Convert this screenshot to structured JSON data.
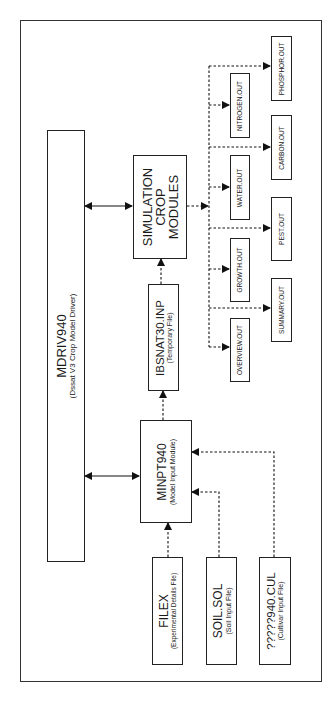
{
  "diagram": {
    "driver": {
      "title": "MDRIV940",
      "subtitle": "(Dssat V3 Crop Model Driver)"
    },
    "simulation": {
      "line1": "SIMULATION",
      "line2": "CROP",
      "line3": "MODULES"
    },
    "temp_file": {
      "title": "IBSNAT30.INP",
      "subtitle": "(Temporary File)"
    },
    "input_module": {
      "title": "MINPT940",
      "subtitle": "(Model Input Module)"
    },
    "inputs": [
      {
        "title": "FILEX",
        "subtitle": "(Experimental Details File)"
      },
      {
        "title": "SOIL.SOL",
        "subtitle": "(Soil Input File)"
      },
      {
        "title": "?????940.CUL",
        "subtitle": "(Cultivar Input File)"
      }
    ],
    "outputs_inner": [
      "NITROGEN.OUT",
      "WATER.OUT",
      "GROWTH.OUT",
      "OVERVIEW.OUT"
    ],
    "outputs_outer": [
      "PHOSPHOR.OUT",
      "CARBON.OUT",
      "PEST.OUT",
      "SUMMARY.OUT"
    ]
  }
}
